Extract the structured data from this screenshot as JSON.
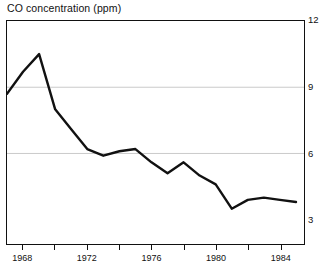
{
  "chart_data": {
    "type": "line",
    "title": "CO concentration (ppm)",
    "xlabel": "",
    "ylabel": "",
    "xlim": [
      1967,
      1985.5
    ],
    "ylim": [
      1.9,
      12.0
    ],
    "grid": "horizontal gridlines at y = 9 and y = 6",
    "legend": "none",
    "y_ticks": [
      12,
      9,
      6,
      3
    ],
    "y_tick_labels": [
      "12",
      "9",
      "6",
      "3"
    ],
    "y_axis_position": "right",
    "x_ticks": [
      1968,
      1970,
      1972,
      1974,
      1976,
      1978,
      1980,
      1982,
      1984
    ],
    "x_tick_labels": [
      "1968",
      "",
      "1972",
      "",
      "1976",
      "",
      "1980",
      "",
      "1984"
    ],
    "x_labeled_ticks": [
      1968,
      1972,
      1976,
      1980,
      1984
    ],
    "series": [
      {
        "name": "CO concentration",
        "x": [
          1967,
          1968,
          1969,
          1970,
          1971,
          1972,
          1973,
          1974,
          1975,
          1976,
          1977,
          1978,
          1979,
          1980,
          1981,
          1982,
          1983,
          1984,
          1985
        ],
        "values": [
          8.7,
          9.7,
          10.5,
          8.0,
          7.1,
          6.2,
          5.9,
          6.1,
          6.2,
          5.6,
          5.1,
          5.6,
          5.0,
          4.6,
          3.5,
          3.9,
          4.0,
          3.9,
          3.8
        ]
      }
    ],
    "line_color": "#111111",
    "grid_color": "#bdbdbd",
    "frame_color": "#111111",
    "background_color": "#ffffff"
  }
}
